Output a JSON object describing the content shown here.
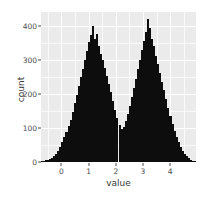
{
  "chart_data": {
    "type": "bar",
    "subtype": "histogram",
    "title": "",
    "xlabel": "value",
    "ylabel": "count",
    "xlim": [
      -0.75,
      4.95
    ],
    "ylim": [
      0,
      440
    ],
    "grid": true,
    "legend": null,
    "theme": "ggplot2-grey",
    "bar_color": "#0d0d0d",
    "panel_background": "#ebebeb",
    "gridline_color": "#ffffff",
    "xticks": [
      0,
      1,
      2,
      3,
      4
    ],
    "xtick_labels": [
      "0",
      "1",
      "2",
      "3",
      "4"
    ],
    "yticks": [
      0,
      100,
      200,
      300,
      400
    ],
    "ytick_labels": [
      "0",
      "100",
      "200",
      "300",
      "400"
    ],
    "x_minor_ticks": [
      -0.5,
      0.5,
      1.5,
      2.5,
      3.5,
      4.5
    ],
    "y_minor_ticks": [
      50,
      150,
      250,
      350
    ],
    "bin_width": 0.075,
    "bin_count": 76,
    "x": [
      -0.7125,
      -0.6375,
      -0.5625,
      -0.4875,
      -0.4125,
      -0.3375,
      -0.2625,
      -0.1875,
      -0.1125,
      -0.0375,
      0.0375,
      0.1125,
      0.1875,
      0.2625,
      0.3375,
      0.4125,
      0.4875,
      0.5625,
      0.6375,
      0.7125,
      0.7875,
      0.8625,
      0.9375,
      1.0125,
      1.0875,
      1.1625,
      1.2375,
      1.3125,
      1.3875,
      1.4625,
      1.5375,
      1.6125,
      1.6875,
      1.7625,
      1.8375,
      1.9125,
      1.9875,
      2.0625,
      2.1375,
      2.2125,
      2.2875,
      2.3625,
      2.4375,
      2.5125,
      2.5875,
      2.6625,
      2.7375,
      2.8125,
      2.8875,
      2.9625,
      3.0375,
      3.1125,
      3.1875,
      3.2625,
      3.3375,
      3.4125,
      3.4875,
      3.5625,
      3.6375,
      3.7125,
      3.7875,
      3.8625,
      3.9375,
      4.0125,
      4.0875,
      4.1625,
      4.2375,
      4.3125,
      4.3875,
      4.4625,
      4.5375,
      4.6125,
      4.6875,
      4.7625,
      4.8375,
      4.9125
    ],
    "values": [
      3,
      2,
      6,
      5,
      9,
      12,
      18,
      24,
      33,
      44,
      58,
      72,
      88,
      105,
      124,
      148,
      172,
      196,
      222,
      248,
      272,
      300,
      326,
      352,
      372,
      398,
      362,
      376,
      340,
      318,
      300,
      276,
      252,
      228,
      204,
      178,
      152,
      128,
      108,
      96,
      104,
      120,
      140,
      164,
      190,
      216,
      244,
      272,
      300,
      330,
      356,
      382,
      420,
      392,
      360,
      340,
      312,
      288,
      262,
      236,
      210,
      184,
      158,
      134,
      112,
      92,
      74,
      58,
      44,
      33,
      24,
      17,
      11,
      7,
      4,
      2
    ],
    "peaks": [
      {
        "x": 1.1625,
        "y": 398,
        "label": "left mode"
      },
      {
        "x": 3.1875,
        "y": 420,
        "label": "right mode"
      }
    ],
    "valley": {
      "x": 2.2125,
      "y": 92
    },
    "distribution": "bimodal"
  },
  "axes": {
    "y_title": "count",
    "x_title": "value"
  }
}
